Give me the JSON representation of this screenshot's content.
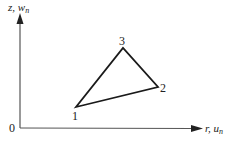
{
  "figure": {
    "type": "coordinate-diagram",
    "axes": {
      "vertical_label": "z, w",
      "vertical_label_sub": "n",
      "horizontal_label": "r, u",
      "horizontal_label_sub": "n",
      "origin_label": "0"
    },
    "triangle": {
      "nodes": [
        {
          "id": "1",
          "label": "1"
        },
        {
          "id": "2",
          "label": "2"
        },
        {
          "id": "3",
          "label": "3"
        }
      ],
      "edges": [
        [
          "1",
          "2"
        ],
        [
          "2",
          "3"
        ],
        [
          "3",
          "1"
        ]
      ]
    },
    "colors": {
      "axis": "#555555",
      "triangle": "#1a1a1a",
      "text": "#222222"
    }
  }
}
